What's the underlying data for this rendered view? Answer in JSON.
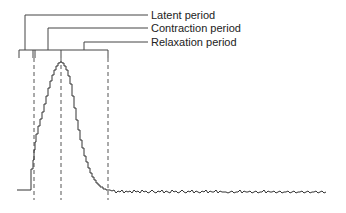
{
  "diagram": {
    "type": "muscle twitch myogram",
    "labels": [
      {
        "id": "latent",
        "text": "Latent period"
      },
      {
        "id": "contraction",
        "text": "Contraction period"
      },
      {
        "id": "relaxation",
        "text": "Relaxation period"
      }
    ],
    "line_color": "#333333",
    "label_color": "#222222"
  }
}
